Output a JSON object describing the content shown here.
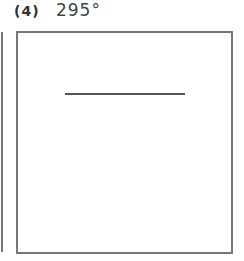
{
  "problem": {
    "number": "(4)",
    "angle": "295°"
  }
}
